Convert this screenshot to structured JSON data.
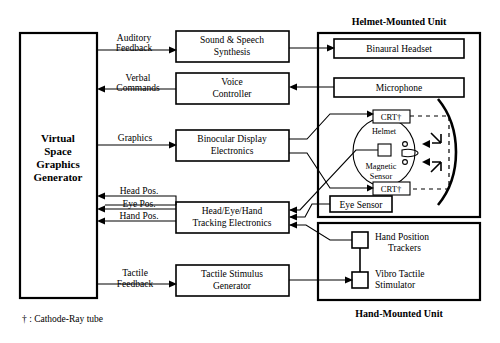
{
  "figure": {
    "type": "block-diagram",
    "footnote": "† :  Cathode-Ray tube"
  },
  "group_titles": {
    "helmet": "Helmet-Mounted Unit",
    "hand": "Hand-Mounted Unit"
  },
  "main_block": {
    "line1": "Virtual",
    "line2": "Space",
    "line3": "Graphics",
    "line4": "Generator"
  },
  "mid_blocks": {
    "sound": {
      "line1": "Sound & Speech",
      "line2": "Synthesis"
    },
    "voice": {
      "line1": "Voice",
      "line2": "Controller"
    },
    "binocular": {
      "line1": "Binocular Display",
      "line2": "Electronics"
    },
    "tracking": {
      "line1": "Head/Eye/Hand",
      "line2": "Tracking Electronics"
    },
    "tactile": {
      "line1": "Tactile Stimulus",
      "line2": "Generator"
    }
  },
  "helmet_unit": {
    "headset": "Binaural Headset",
    "microphone": "Microphone",
    "crt_top": "CRT†",
    "crt_bottom": "CRT†",
    "eye_sensor": "Eye Sensor",
    "helmet_label": "Helmet",
    "magnetic_line1": "Magnetic",
    "magnetic_line2": "Sensor"
  },
  "hand_unit": {
    "trackers_line1": "Hand Position",
    "trackers_line2": "Trackers",
    "stimulator_line1": "Vibro Tactile",
    "stimulator_line2": "Stimulator"
  },
  "signal_labels": {
    "auditory_1": "Auditory",
    "auditory_2": "Feedback",
    "verbal_1": "Verbal",
    "verbal_2": "Commands",
    "graphics": "Graphics",
    "head_pos": "Head Pos.",
    "eye_pos": "Eye Pos.",
    "hand_pos": "Hand Pos.",
    "tactile_1": "Tactile",
    "tactile_2": "Feedback"
  },
  "colors": {
    "stroke": "#000000",
    "fill": "#ffffff",
    "background": "#ffffff"
  }
}
